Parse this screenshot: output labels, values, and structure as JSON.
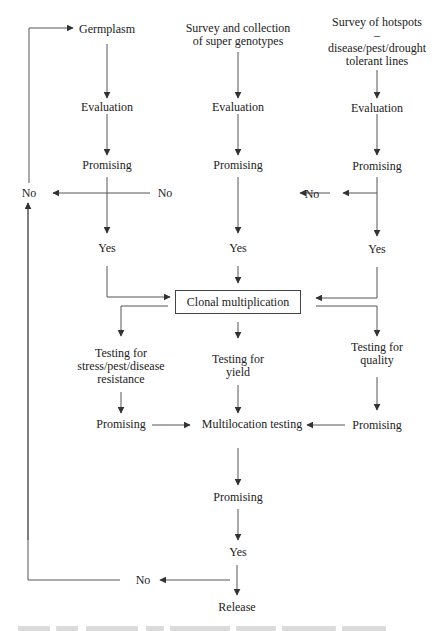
{
  "diagram": {
    "sources": {
      "germplasm": "Germplasm",
      "survey_genotypes": "Survey and collection\nof super genotypes",
      "survey_hotspots": "Survey of hotspots –\ndisease/pest/drought\ntolerant lines"
    },
    "evaluation": [
      "Evaluation",
      "Evaluation",
      "Evaluation"
    ],
    "promising_top": [
      "Promising",
      "Promising",
      "Promising"
    ],
    "no_labels": {
      "far_left": "No",
      "middle": "No",
      "right": "No",
      "bottom": "No"
    },
    "yes_top": [
      "Yes",
      "Yes",
      "Yes"
    ],
    "clonal": "Clonal multiplication",
    "testing": {
      "stress": "Testing for\nstress/pest/disease\nresistance",
      "yield": "Testing for\nyield",
      "quality": "Testing for\nquality"
    },
    "promising_mid": {
      "left": "Promising",
      "right": "Promising"
    },
    "multilocation": "Multilocation testing",
    "promising_final": "Promising",
    "yes_final": "Yes",
    "release": "Release"
  },
  "colors": {
    "line": "#444444",
    "text": "#222222",
    "background": "#ffffff"
  }
}
